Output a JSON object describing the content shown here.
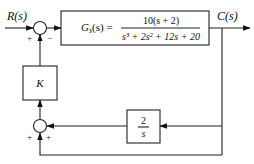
{
  "diagram": {
    "type": "block-diagram",
    "input_label": "R(s)",
    "output_label": "C(s)",
    "forward_block": {
      "name": "Gs(s)",
      "lhs": "G",
      "lhs_sub": "s",
      "lhs_arg": "(s) =",
      "numerator": "10(s + 2)",
      "denominator": "s³ + 2s² + 12s + 20"
    },
    "gain_block": {
      "label": "K"
    },
    "integrator_block": {
      "numerator": "2",
      "denominator": "s"
    },
    "summing_junction_top": {
      "signs": {
        "left": "+",
        "right": "−"
      }
    },
    "summing_junction_bottom": {
      "signs": {
        "left": "+",
        "right": "+"
      }
    },
    "colors": {
      "line": "#222222",
      "background": "#ffffff"
    }
  }
}
